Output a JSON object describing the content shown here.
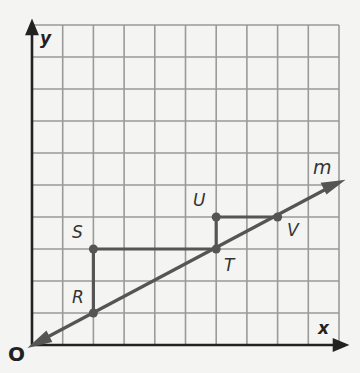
{
  "diagram": {
    "type": "coordinate-grid-slope-triangles",
    "grid": {
      "columns": 10,
      "rows": 10
    },
    "axes": {
      "x_label": "x",
      "y_label": "y",
      "origin_label": "O"
    },
    "line": {
      "label": "m",
      "slope": "1/2",
      "passes_through": [
        0,
        0
      ]
    },
    "points": [
      {
        "label": "R",
        "x": 2,
        "y": 1
      },
      {
        "label": "S",
        "x": 2,
        "y": 3
      },
      {
        "label": "T",
        "x": 6,
        "y": 3
      },
      {
        "label": "U",
        "x": 6,
        "y": 4
      },
      {
        "label": "V",
        "x": 8,
        "y": 4
      }
    ],
    "segments": [
      [
        "R",
        "S"
      ],
      [
        "S",
        "T"
      ],
      [
        "T",
        "U"
      ],
      [
        "U",
        "V"
      ]
    ],
    "colors": {
      "grid": "#9a9a9a",
      "axis": "#222222",
      "figure": "#555555",
      "background": "#f4f4f2"
    }
  }
}
